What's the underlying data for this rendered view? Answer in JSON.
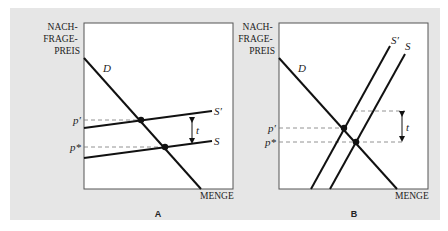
{
  "figure": {
    "background_color": "#e6e6e6",
    "plot_color": "#ffffff",
    "line_color": "#111111",
    "panels": [
      {
        "id": "A",
        "label": "A",
        "y_axis_label_lines": [
          "NACH-",
          "FRAGE-",
          "PREIS"
        ],
        "x_axis_label": "MENGE",
        "curves": {
          "demand": "D",
          "supply": "S",
          "supply_shifted": "S′"
        },
        "prices": {
          "p_prime": "p′",
          "p_star": "p*"
        },
        "tax_label": "t",
        "description": "Elastic (flat) supply: tax largely borne by consumers"
      },
      {
        "id": "B",
        "label": "B",
        "y_axis_label_lines": [
          "NACH-",
          "FRAGE-",
          "PREIS"
        ],
        "x_axis_label": "MENGE",
        "curves": {
          "demand": "D",
          "supply": "S",
          "supply_shifted": "S′"
        },
        "prices": {
          "p_prime": "p′",
          "p_star": "p*"
        },
        "tax_label": "t",
        "description": "Inelastic (steep) supply: tax largely borne by producers"
      }
    ]
  }
}
